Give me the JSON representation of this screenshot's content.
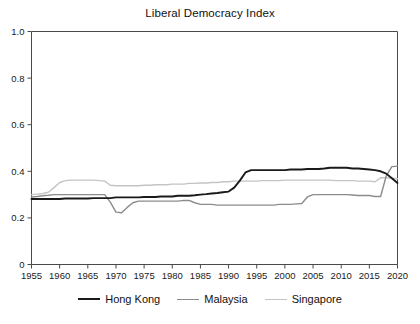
{
  "chart_data": {
    "type": "line",
    "title": "Liberal Democracy Index",
    "xlabel": "",
    "ylabel": "",
    "xlim": [
      1955,
      2020
    ],
    "ylim": [
      0,
      1.0
    ],
    "grid": false,
    "legend_position": "bottom",
    "y_ticks": [
      "0",
      "0.2",
      "0.4",
      "0.6",
      "0.8",
      "1.0"
    ],
    "y_tick_values": [
      0,
      0.2,
      0.4,
      0.6,
      0.8,
      1.0
    ],
    "x_ticks": [
      "1955",
      "1960",
      "1965",
      "1970",
      "1975",
      "1980",
      "1985",
      "1990",
      "1995",
      "2000",
      "2005",
      "2010",
      "2015",
      "2020"
    ],
    "x_tick_values": [
      1955,
      1960,
      1965,
      1970,
      1975,
      1980,
      1985,
      1990,
      1995,
      2000,
      2005,
      2010,
      2015,
      2020
    ],
    "x": [
      1955,
      1956,
      1957,
      1958,
      1959,
      1960,
      1961,
      1962,
      1963,
      1964,
      1965,
      1966,
      1967,
      1968,
      1969,
      1970,
      1971,
      1972,
      1973,
      1974,
      1975,
      1976,
      1977,
      1978,
      1979,
      1980,
      1981,
      1982,
      1983,
      1984,
      1985,
      1986,
      1987,
      1988,
      1989,
      1990,
      1991,
      1992,
      1993,
      1994,
      1995,
      1996,
      1997,
      1998,
      1999,
      2000,
      2001,
      2002,
      2003,
      2004,
      2005,
      2006,
      2007,
      2008,
      2009,
      2010,
      2011,
      2012,
      2013,
      2014,
      2015,
      2016,
      2017,
      2018,
      2019,
      2020
    ],
    "series": [
      {
        "name": "Hong Kong",
        "color": "#1a1a1a",
        "width": 1.9,
        "values": [
          0.281,
          0.281,
          0.281,
          0.281,
          0.281,
          0.281,
          0.283,
          0.283,
          0.283,
          0.283,
          0.283,
          0.285,
          0.285,
          0.285,
          0.285,
          0.288,
          0.288,
          0.288,
          0.288,
          0.288,
          0.29,
          0.29,
          0.29,
          0.292,
          0.292,
          0.292,
          0.295,
          0.295,
          0.295,
          0.297,
          0.3,
          0.302,
          0.305,
          0.307,
          0.31,
          0.313,
          0.33,
          0.36,
          0.395,
          0.405,
          0.405,
          0.405,
          0.405,
          0.405,
          0.405,
          0.405,
          0.408,
          0.408,
          0.408,
          0.41,
          0.41,
          0.41,
          0.412,
          0.415,
          0.415,
          0.415,
          0.415,
          0.412,
          0.412,
          0.41,
          0.408,
          0.405,
          0.4,
          0.39,
          0.37,
          0.35
        ]
      },
      {
        "name": "Malaysia",
        "color": "#8c8c8c",
        "width": 1.4,
        "values": [
          0.29,
          0.292,
          0.295,
          0.297,
          0.3,
          0.3,
          0.3,
          0.3,
          0.3,
          0.3,
          0.3,
          0.3,
          0.3,
          0.3,
          0.268,
          0.225,
          0.222,
          0.245,
          0.265,
          0.272,
          0.272,
          0.272,
          0.272,
          0.272,
          0.272,
          0.272,
          0.272,
          0.275,
          0.275,
          0.265,
          0.258,
          0.258,
          0.258,
          0.255,
          0.255,
          0.255,
          0.255,
          0.255,
          0.255,
          0.255,
          0.255,
          0.255,
          0.255,
          0.255,
          0.258,
          0.258,
          0.258,
          0.26,
          0.262,
          0.29,
          0.3,
          0.3,
          0.3,
          0.3,
          0.3,
          0.3,
          0.3,
          0.298,
          0.296,
          0.296,
          0.296,
          0.292,
          0.292,
          0.38,
          0.42,
          0.422
        ]
      },
      {
        "name": "Singapore",
        "color": "#c4c4c4",
        "width": 1.4,
        "values": [
          0.3,
          0.302,
          0.305,
          0.31,
          0.33,
          0.352,
          0.36,
          0.362,
          0.362,
          0.362,
          0.362,
          0.362,
          0.36,
          0.358,
          0.34,
          0.338,
          0.338,
          0.338,
          0.338,
          0.338,
          0.34,
          0.34,
          0.342,
          0.342,
          0.342,
          0.345,
          0.345,
          0.345,
          0.348,
          0.348,
          0.35,
          0.35,
          0.352,
          0.352,
          0.355,
          0.355,
          0.358,
          0.358,
          0.358,
          0.358,
          0.358,
          0.36,
          0.36,
          0.36,
          0.36,
          0.362,
          0.362,
          0.362,
          0.362,
          0.362,
          0.362,
          0.362,
          0.362,
          0.362,
          0.36,
          0.36,
          0.36,
          0.36,
          0.358,
          0.358,
          0.358,
          0.355,
          0.372,
          0.372,
          0.37,
          0.368
        ]
      }
    ]
  },
  "legend": {
    "entries": [
      {
        "label": "Hong Kong"
      },
      {
        "label": "Malaysia"
      },
      {
        "label": "Singapore"
      }
    ]
  },
  "axes": {
    "frame_color": "#4a4a4a"
  }
}
